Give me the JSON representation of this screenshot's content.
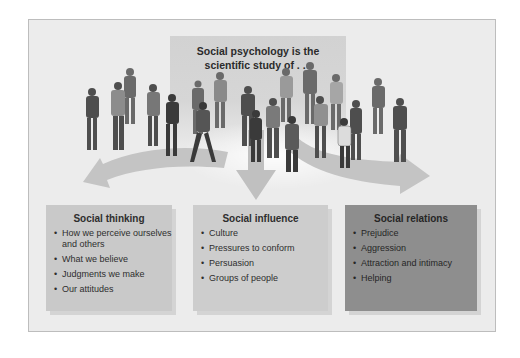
{
  "header": {
    "title_line1": "Social psychology is the",
    "title_line2": "scientific study of . . ."
  },
  "colors": {
    "frame_bg": "#ececec",
    "header_panel": "#d2d2d2",
    "box_thinking": "#c9c9c9",
    "box_influence": "#cdcdcd",
    "box_relations": "#8e8e8e",
    "arrow": "#c4c4c4"
  },
  "illustration": {
    "description": "crowd of diverse people standing",
    "arrows": [
      "arrow-to-social-thinking",
      "arrow-to-social-influence",
      "arrow-to-social-relations"
    ]
  },
  "boxes": [
    {
      "title": "Social thinking",
      "items": [
        "How we perceive ourselves and others",
        "What we believe",
        "Judgments we make",
        "Our attitudes"
      ]
    },
    {
      "title": "Social influence",
      "items": [
        "Culture",
        "Pressures to conform",
        "Persuasion",
        "Groups of people"
      ]
    },
    {
      "title": "Social relations",
      "items": [
        "Prejudice",
        "Aggression",
        "Attraction and intimacy",
        "Helping"
      ]
    }
  ]
}
